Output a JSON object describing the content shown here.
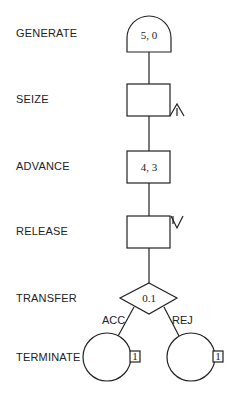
{
  "diagram": {
    "type": "GPSS block diagram",
    "blocks": [
      {
        "name": "GENERATE",
        "symbol": "semicircle",
        "operand": "5, 0"
      },
      {
        "name": "SEIZE",
        "symbol": "rectangle",
        "marker": "/\\",
        "operand": ""
      },
      {
        "name": "ADVANCE",
        "symbol": "rectangle",
        "operand": "4, 3"
      },
      {
        "name": "RELEASE",
        "symbol": "rectangle",
        "marker": "\\/",
        "operand": ""
      },
      {
        "name": "TRANSFER",
        "symbol": "diamond",
        "operand": "0.1"
      },
      {
        "name": "TERMINATE",
        "symbol": "circle",
        "count": "1"
      }
    ],
    "branches": {
      "left": "ACC",
      "right": "REJ"
    },
    "terminate_counts": [
      "1",
      "1"
    ]
  }
}
